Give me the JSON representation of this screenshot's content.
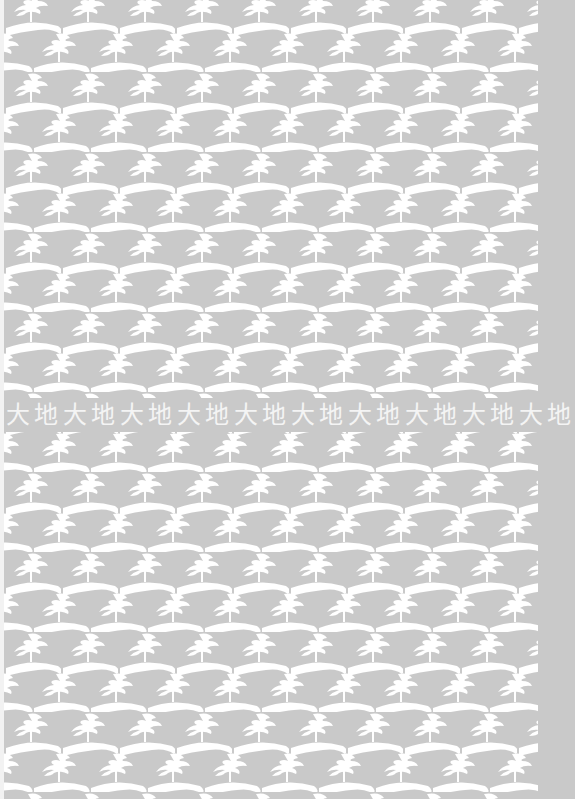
{
  "pattern": {
    "motif": "tree-on-hill-icon",
    "background_color": "#c9c9c9",
    "motif_color": "#ffffff",
    "period_x": 57,
    "period_y": 40,
    "row_offset": 28
  },
  "band": {
    "text": "大地",
    "repeat": 10,
    "color": "#f4f4f4"
  }
}
